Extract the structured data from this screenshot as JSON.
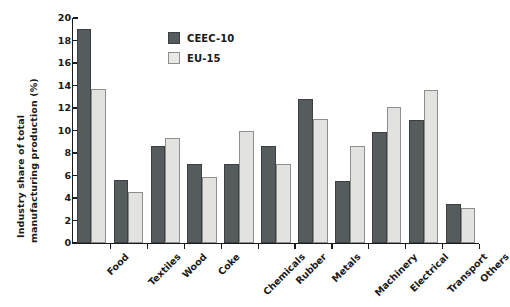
{
  "chart_data": {
    "type": "bar",
    "title": "",
    "subtitle": "",
    "xlabel": "",
    "ylabel": "Industry share of total manufacturing production (%)",
    "ylabel_line1": "Industry share of total",
    "ylabel_line2": "manufacturing production (%)",
    "ylim": [
      0,
      20
    ],
    "ytick_step": 2,
    "ytick_labels": [
      "0",
      "2",
      "4",
      "6",
      "8",
      "10",
      "12",
      "14",
      "16",
      "18",
      "20"
    ],
    "grid": false,
    "legend_position": "top-center",
    "categories": [
      "Food",
      "Textiles",
      "Wood",
      "Coke",
      "Chemicals",
      "Rubber",
      "Metals",
      "Machinery",
      "Electrical",
      "Transport",
      "Others"
    ],
    "series": [
      {
        "name": "CEEC-10",
        "color": "#565b5d",
        "values": [
          19.0,
          5.6,
          8.6,
          7.0,
          7.0,
          8.6,
          12.8,
          5.5,
          9.9,
          10.9,
          3.5
        ]
      },
      {
        "name": "EU-15",
        "color": "#e2e2e0",
        "values": [
          13.7,
          4.5,
          9.35,
          5.9,
          10.0,
          7.0,
          11.0,
          8.6,
          12.1,
          13.6,
          3.1
        ]
      }
    ]
  },
  "legend": {
    "items": [
      {
        "label": "CEEC-10",
        "swatch": "ceec"
      },
      {
        "label": "EU-15",
        "swatch": "eu"
      }
    ]
  }
}
